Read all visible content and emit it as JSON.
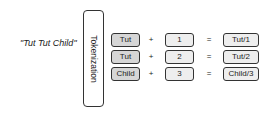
{
  "input": {
    "text": "\"Tut Tut Child\""
  },
  "stage": {
    "label": "Tokenization"
  },
  "rows": [
    {
      "token": "Tut",
      "plus": "+",
      "index": "1",
      "equals": "=",
      "result": "Tut/1"
    },
    {
      "token": "Tut",
      "plus": "+",
      "index": "2",
      "equals": "=",
      "result": "Tut/2"
    },
    {
      "token": "Child",
      "plus": "+",
      "index": "3",
      "equals": "=",
      "result": "Child/3"
    }
  ]
}
